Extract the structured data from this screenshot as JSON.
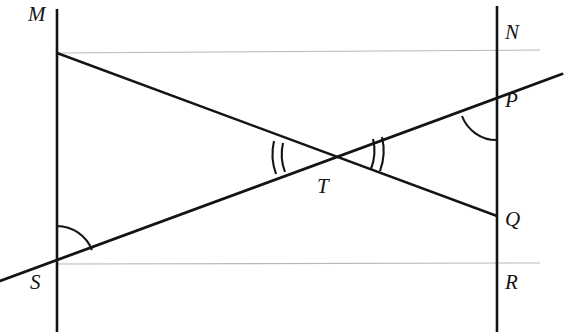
{
  "figure": {
    "kind": "geometry-diagram",
    "width": 565,
    "height": 332,
    "background_color": "#ffffff",
    "stroke_color": "#141414",
    "guide_color": "#b9b9b9"
  },
  "labels": {
    "m": "M",
    "n": "N",
    "p": "P",
    "q": "Q",
    "r": "R",
    "s": "S",
    "t": "T"
  },
  "points": {
    "M": {
      "label": "M",
      "x": 57,
      "y": 53,
      "label_x": 28,
      "label_y": 4
    },
    "N": {
      "label": "N",
      "x": 497,
      "y": 53,
      "label_x": 505,
      "label_y": 22
    },
    "P": {
      "label": "P",
      "x": 497,
      "y": 103,
      "label_x": 505,
      "label_y": 90
    },
    "Q": {
      "label": "Q",
      "x": 497,
      "y": 216,
      "label_x": 505,
      "label_y": 209
    },
    "R": {
      "label": "R",
      "x": 497,
      "y": 264,
      "label_x": 505,
      "label_y": 272
    },
    "S": {
      "label": "S",
      "x": 57,
      "y": 264,
      "label_x": 30,
      "label_y": 272
    },
    "T": {
      "label": "T",
      "x": 328,
      "y": 157,
      "label_x": 317,
      "label_y": 176
    }
  },
  "segments": {
    "left_vertical": {
      "name": "line-MS",
      "x1": 57,
      "y1": 9,
      "x2": 57,
      "y2": 332
    },
    "right_vertical": {
      "name": "line-NR",
      "x1": 497,
      "y1": 6,
      "x2": 497,
      "y2": 332
    },
    "transversal_mq": {
      "name": "line-MQ",
      "x1": 57,
      "y1": 53,
      "x2": 497,
      "y2": 216
    },
    "transversal_sp": {
      "name": "line-SP",
      "x1": 0,
      "y1": 281,
      "x2": 562,
      "y2": 74
    }
  },
  "guides": {
    "top_guide": {
      "name": "guide-top",
      "x1": 57,
      "y1": 53,
      "x2": 540,
      "y2": 50
    },
    "bottom_guide": {
      "name": "guide-bottom",
      "x1": 57,
      "y1": 264,
      "x2": 540,
      "y2": 263
    }
  },
  "angle_marks": {
    "at_S": {
      "name": "angle-arc-S",
      "count": 1,
      "vertex": "S"
    },
    "at_P": {
      "name": "angle-arc-P",
      "count": 1,
      "vertex": "P"
    },
    "at_T_left": {
      "name": "angle-arc-T-left",
      "count": 2,
      "vertex": "T"
    },
    "at_T_right": {
      "name": "angle-arc-T-right",
      "count": 2,
      "vertex": "T"
    }
  }
}
